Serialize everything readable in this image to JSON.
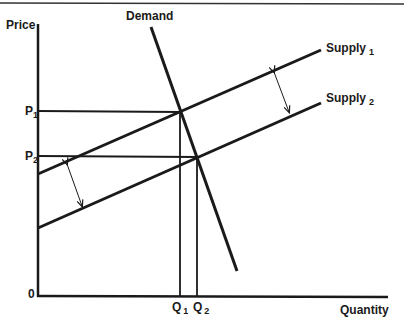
{
  "diagram": {
    "axes": {
      "y_label": "Price",
      "x_label": "Quantity",
      "origin_label": "0"
    },
    "curves": {
      "demand": {
        "label": "Demand"
      },
      "supply1": {
        "label": "Supply",
        "subscript": "1"
      },
      "supply2": {
        "label": "Supply",
        "subscript": "2"
      }
    },
    "price_levels": [
      {
        "label": "P",
        "subscript": "1"
      },
      {
        "label": "P",
        "subscript": "2"
      }
    ],
    "quantity_levels": [
      {
        "label": "Q",
        "subscript": "1"
      },
      {
        "label": "Q",
        "subscript": "2"
      }
    ],
    "colors": {
      "line": "#1a1a1a",
      "background": "#ffffff"
    }
  }
}
